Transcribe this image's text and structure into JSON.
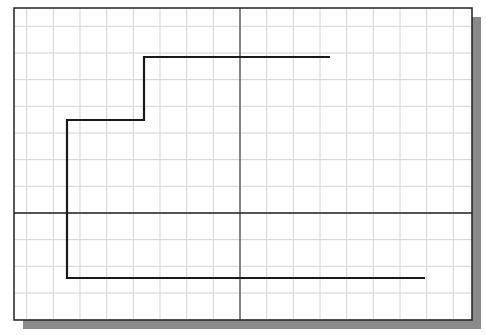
{
  "canvas": {
    "width": 486,
    "height": 335,
    "background": "#ffffff"
  },
  "frame": {
    "x": 14,
    "y": 8,
    "width": 458,
    "height": 312,
    "border_color": "#222222",
    "shadow_color": "#8a8a8a",
    "shadow_offset": 9
  },
  "grid": {
    "spacing": 26.67,
    "color": "#d4d4d4",
    "origin_x": 240,
    "origin_y": 213
  },
  "axes": {
    "x_axis_y": 213,
    "y_axis_x": 240,
    "color": "#222222"
  },
  "polyline": {
    "label": "stepped-profile",
    "color": "#1a1a1a",
    "stroke_width": 2.2,
    "points": [
      [
        330,
        57
      ],
      [
        144,
        57
      ],
      [
        144,
        120
      ],
      [
        67,
        120
      ],
      [
        67,
        278
      ],
      [
        425,
        278
      ]
    ]
  }
}
